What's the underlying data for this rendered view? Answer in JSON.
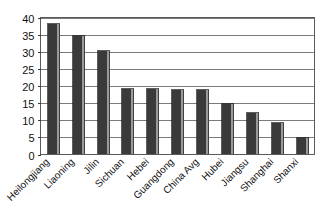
{
  "chart_data": {
    "type": "bar",
    "title": "",
    "subtitle": "",
    "xlabel": "",
    "ylabel": "",
    "categories": [
      "Heilongjiang",
      "Liaoning",
      "Jilin",
      "Sichuan",
      "Hebei",
      "Guangdong",
      "China Avg",
      "Hubei",
      "Jiangsu",
      "Shanghai",
      "Shanxi"
    ],
    "values": [
      38.5,
      35.0,
      30.5,
      19.5,
      19.5,
      19.0,
      19.0,
      15.0,
      12.5,
      9.5,
      5.0
    ],
    "ylim": [
      0,
      40
    ],
    "yticks": [
      0,
      5,
      10,
      15,
      20,
      25,
      30,
      35,
      40
    ],
    "ytick_labels": [
      "0",
      "5",
      "10",
      "15",
      "20",
      "25",
      "30",
      "35",
      "40"
    ],
    "grid": true,
    "legend": false,
    "legend_position": "none",
    "xtick_rotation": 45,
    "series": [
      {
        "name": "",
        "values": [
          38.5,
          35.0,
          30.5,
          19.5,
          19.5,
          19.0,
          19.0,
          15.0,
          12.5,
          9.5,
          5.0
        ]
      }
    ]
  },
  "colors": {
    "bar_fill": "#3a3a3a",
    "bar_highlight": "#9a9a9a",
    "bar_outline": "#1a1a1a",
    "grid": "#5a5a5a",
    "axis": "#5a5a5a",
    "text": "#111111",
    "background": "#ffffff"
  }
}
